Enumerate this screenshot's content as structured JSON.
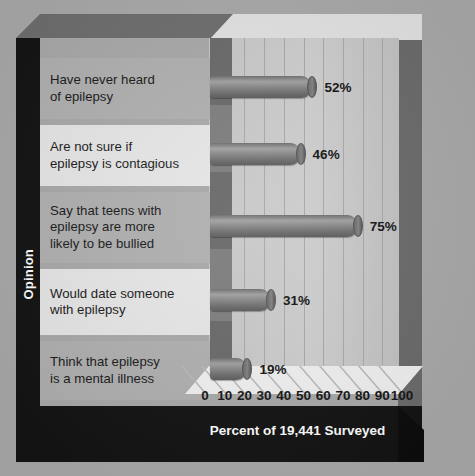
{
  "chart_data": {
    "type": "bar",
    "orientation": "horizontal",
    "title": "Percent of 19,441 Surveyed",
    "xlabel": "Percent of 19,441 Surveyed",
    "ylabel": "Opinion",
    "xlim": [
      0,
      100
    ],
    "xticks": [
      "0",
      "10",
      "20",
      "30",
      "40",
      "50",
      "60",
      "70",
      "80",
      "90",
      "100"
    ],
    "grid": true,
    "legend": "none",
    "categories": [
      "Have never heard of epilepsy",
      "Are not sure if epilepsy is contagious",
      "Say that teens with epilepsy are more likely to be bullied",
      "Would date someone with epilepsy",
      "Think that epilepsy is a mental illness"
    ],
    "values": [
      52,
      46,
      75,
      31,
      19
    ],
    "value_labels": [
      "52%",
      "46%",
      "75%",
      "31%",
      "19%"
    ],
    "bar_color": "#7c7c7c"
  },
  "axis": {
    "y_title": "Opinion",
    "x_title": "Percent of 19,441 Surveyed",
    "ticks": [
      "0",
      "10",
      "20",
      "30",
      "40",
      "50",
      "60",
      "70",
      "80",
      "90",
      "100"
    ]
  },
  "rows": [
    {
      "line1": "Have never heard",
      "line2": "of epilepsy",
      "line3": "",
      "value": "52%"
    },
    {
      "line1": "Are not sure if",
      "line2": "epilepsy is contagious",
      "line3": "",
      "value": "46%"
    },
    {
      "line1": "Say that teens with",
      "line2": "epilepsy are more",
      "line3": "likely to be bullied",
      "value": "75%"
    },
    {
      "line1": "Would date someone",
      "line2": "with epilepsy",
      "line3": "",
      "value": "31%"
    },
    {
      "line1": "Think that epilepsy",
      "line2": "is a mental illness",
      "line3": "",
      "value": "19%"
    }
  ],
  "colors": {
    "background": "#a9a9a9",
    "frame_dark": "#141414",
    "plot_wall": "#c9c9c9",
    "floor": "#f0f0f0",
    "bar": "#7c7c7c",
    "row_dark": "#b0b0b0",
    "row_light": "#e6e6e6",
    "text": "#161616",
    "title_text": "#ffffff"
  }
}
